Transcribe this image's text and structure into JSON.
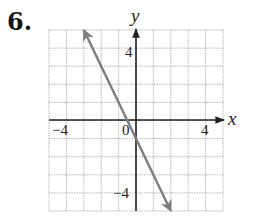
{
  "problem": {
    "number": "6."
  },
  "chart_data": {
    "type": "line",
    "title": "",
    "xlabel": "x",
    "ylabel": "y",
    "xlim": [
      -5,
      5
    ],
    "ylim": [
      -5,
      5
    ],
    "grid": true,
    "x_tick_labels": [
      "-4",
      "0",
      "4"
    ],
    "y_tick_labels": [
      "4",
      "-4"
    ],
    "series": [
      {
        "name": "line",
        "equation": "y = -2x - 1",
        "x": [
          -3,
          2
        ],
        "y": [
          5,
          -5
        ],
        "arrows_both_ends": true,
        "color": "#7d7d7d"
      }
    ]
  },
  "labels": {
    "x_axis": "x",
    "y_axis": "y",
    "x_neg4": "−4",
    "x_0": "0",
    "x_4": "4",
    "y_4": "4",
    "y_neg4": "−4"
  },
  "colors": {
    "grid": "#b5b5b5",
    "axis": "#222222",
    "line": "#7d7d7d"
  }
}
